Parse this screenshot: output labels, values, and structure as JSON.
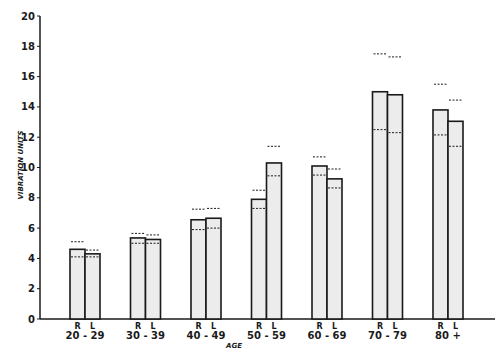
{
  "chart_data": {
    "type": "bar",
    "title": "",
    "xlabel": "AGE",
    "ylabel": "VIBRATION UNITS",
    "ylim": [
      0,
      20
    ],
    "yticks": [
      0,
      2,
      4,
      6,
      8,
      10,
      12,
      14,
      16,
      18,
      20
    ],
    "grid": false,
    "legend": null,
    "categories": [
      "20 - 29",
      "30 - 39",
      "40 - 49",
      "50 - 59",
      "60 - 69",
      "70 - 79",
      "80 +"
    ],
    "bar_sublabels": [
      "R",
      "L"
    ],
    "series": [
      {
        "name": "R",
        "values": [
          4.6,
          5.35,
          6.55,
          7.9,
          10.1,
          15.0,
          13.8
        ],
        "upper_dashed": [
          5.1,
          5.65,
          7.25,
          8.5,
          10.7,
          17.5,
          15.5
        ],
        "lower_dashed": [
          4.1,
          5.0,
          5.9,
          7.3,
          9.5,
          12.5,
          12.15
        ]
      },
      {
        "name": "L",
        "values": [
          4.3,
          5.25,
          6.65,
          10.3,
          9.25,
          14.8,
          13.05
        ],
        "upper_dashed": [
          4.55,
          5.55,
          7.3,
          11.4,
          9.9,
          17.3,
          14.45
        ],
        "lower_dashed": [
          4.1,
          5.0,
          6.0,
          9.45,
          8.65,
          12.3,
          11.4
        ]
      }
    ]
  },
  "colors": {
    "ink": "#1a1a1a",
    "bar_fill": "#ececec",
    "background": "#ffffff"
  }
}
